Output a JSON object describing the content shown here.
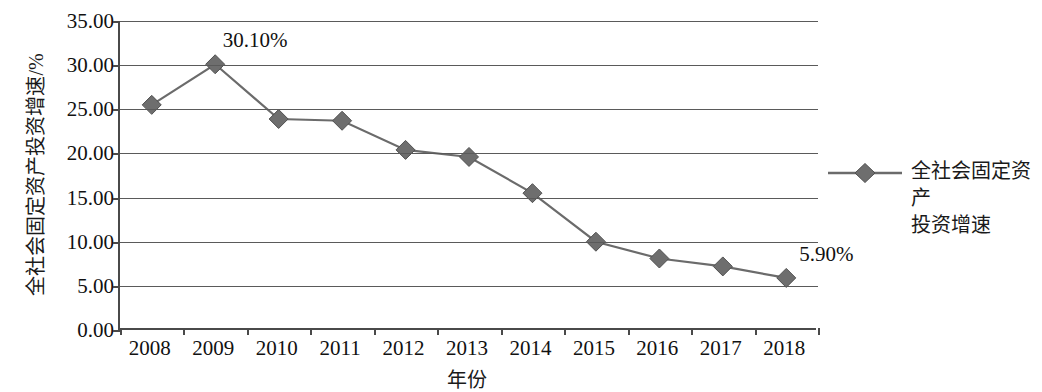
{
  "chart_data": {
    "type": "line",
    "title": "",
    "xlabel": "年份",
    "ylabel": "全社会固定资产投资增速/%",
    "categories": [
      "2008",
      "2009",
      "2010",
      "2011",
      "2012",
      "2013",
      "2014",
      "2015",
      "2016",
      "2017",
      "2018"
    ],
    "series": [
      {
        "name": "全社会固定资产投资增速",
        "values": [
          25.5,
          30.1,
          23.9,
          23.7,
          20.4,
          19.6,
          15.5,
          10.0,
          8.1,
          7.2,
          5.9
        ]
      }
    ],
    "ylim": [
      0,
      35
    ],
    "yticks": [
      "0.00",
      "5.00",
      "10.00",
      "15.00",
      "20.00",
      "25.00",
      "30.00",
      "35.00"
    ],
    "ytick_values": [
      0,
      5,
      10,
      15,
      20,
      25,
      30,
      35
    ],
    "grid": true,
    "legend_position": "right",
    "annotations": [
      {
        "category": "2009",
        "value": 30.1,
        "text": "30.10%"
      },
      {
        "category": "2018",
        "value": 5.9,
        "text": "5.90%"
      }
    ],
    "colors": {
      "series_line": "#6b6b6b",
      "marker": "#6e6e6e",
      "grid": "#5a5a5a",
      "axis": "#4a4a4a",
      "text": "#111111"
    }
  },
  "legend": {
    "entries": [
      {
        "label_line1": "全社会固定资产",
        "label_line2": "投资增速"
      }
    ]
  }
}
